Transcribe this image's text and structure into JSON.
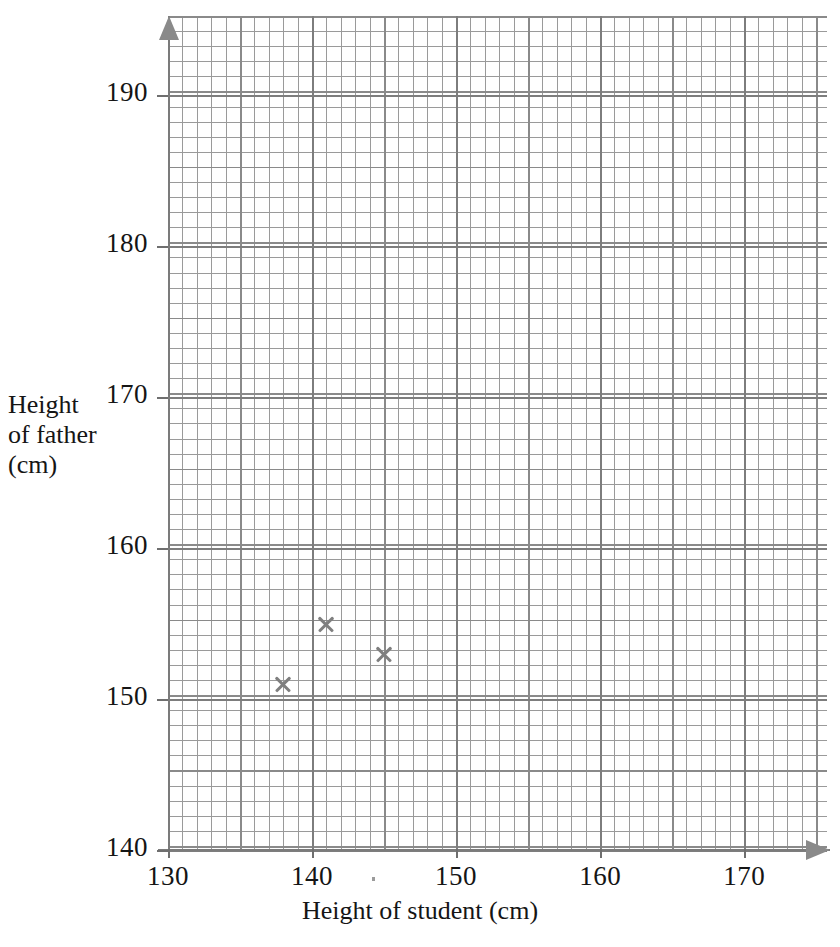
{
  "chart_data": {
    "type": "scatter",
    "title": "",
    "xlabel": "Height of student (cm)",
    "ylabel": "Height of father (cm)",
    "ylabel_lines": [
      "Height",
      "of father",
      "(cm)"
    ],
    "xlim": [
      130,
      175.75
    ],
    "ylim": [
      140,
      195.25
    ],
    "xticks": [
      130,
      140,
      150,
      160,
      170
    ],
    "xtick_labels": [
      "130",
      "140",
      "150",
      "160",
      "170"
    ],
    "yticks": [
      140,
      150,
      160,
      170,
      180,
      190
    ],
    "ytick_labels": [
      "140",
      "150",
      "160",
      "170",
      "180",
      "190"
    ],
    "grid": true,
    "grid_minor": true,
    "grid_major_step_x": 5,
    "grid_major_step_y": 5,
    "legend": null,
    "marker": "x",
    "marker_color": "#7f7f7f",
    "grid_color": "#9a9a9a",
    "grid_minor_color": "#d8d8d8",
    "axis_color": "#7b7b7b",
    "points": [
      {
        "x": 138,
        "y": 151
      },
      {
        "x": 141,
        "y": 155
      },
      {
        "x": 145,
        "y": 153
      }
    ]
  }
}
